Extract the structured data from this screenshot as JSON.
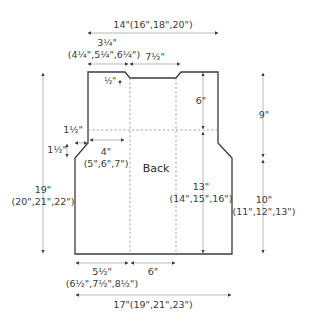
{
  "piece_label": "Back",
  "dimensions": {
    "top_width": "14\"(16\",18\",20\")",
    "shoulder_width_line1": "3¼\"",
    "shoulder_width_line2": "(4¼\",5¼\",6¼\")",
    "neck_width": "7½\"",
    "neck_depth": "½\"",
    "armhole_depth_inner": "6\"",
    "armhole_total": "9\"",
    "armhole_bindoff_h": "1½\"",
    "armhole_bindoff_v": "1½\"",
    "armhole_shaping_line1": "4\"",
    "armhole_shaping_line2": "(5\",6\",7\")",
    "total_length_line1": "19\"",
    "total_length_line2": "(20\",21\",22\")",
    "center_length_line1": "13\"",
    "center_length_line2": "(14\",15\",16\")",
    "side_length_line1": "10\"",
    "side_length_line2": "(11\",12\",13\")",
    "lower_side_line1": "5½\"",
    "lower_side_line2": "(6½\",7½\",8½\")",
    "lower_center": "6\"",
    "bottom_width": "17\"(19\",21\",23\")"
  },
  "colors": {
    "outline": "#3a3a3a",
    "dimension_line": "#9a9a9a",
    "text": "#3a3a3a"
  }
}
